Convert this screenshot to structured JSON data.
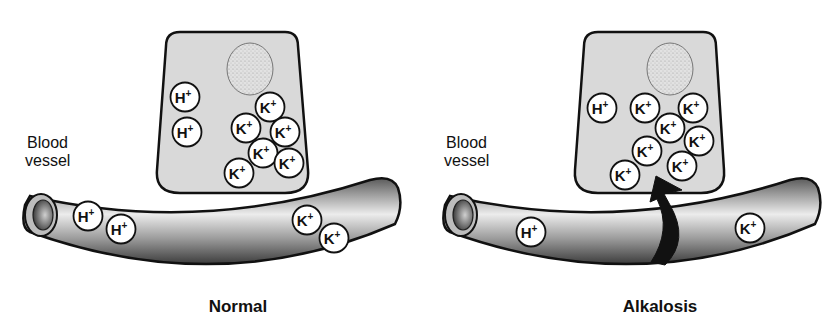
{
  "panels": [
    {
      "id": "normal",
      "caption": "Normal",
      "vessel_label_line1": "Blood",
      "vessel_label_line2": "vessel",
      "cell_ions": [
        {
          "type": "H",
          "label": "H",
          "sup": "+",
          "x": 185,
          "y": 97
        },
        {
          "type": "H",
          "label": "H",
          "sup": "+",
          "x": 187,
          "y": 132
        },
        {
          "type": "K",
          "label": "K",
          "sup": "+",
          "x": 270,
          "y": 107
        },
        {
          "type": "K",
          "label": "K",
          "sup": "+",
          "x": 246,
          "y": 128
        },
        {
          "type": "K",
          "label": "K",
          "sup": "+",
          "x": 285,
          "y": 132
        },
        {
          "type": "K",
          "label": "K",
          "sup": "+",
          "x": 263,
          "y": 153
        },
        {
          "type": "K",
          "label": "K",
          "sup": "+",
          "x": 289,
          "y": 163
        },
        {
          "type": "K",
          "label": "K",
          "sup": "+",
          "x": 239,
          "y": 173
        }
      ],
      "vessel_ions": [
        {
          "type": "H",
          "label": "H",
          "sup": "+",
          "x": 88,
          "y": 216
        },
        {
          "type": "H",
          "label": "H",
          "sup": "+",
          "x": 121,
          "y": 229
        },
        {
          "type": "K",
          "label": "K",
          "sup": "+",
          "x": 307,
          "y": 220
        },
        {
          "type": "K",
          "label": "K",
          "sup": "+",
          "x": 334,
          "y": 238
        }
      ]
    },
    {
      "id": "alkalosis",
      "caption": "Alkalosis",
      "vessel_label_line1": "Blood",
      "vessel_label_line2": "vessel",
      "arrow": "K+ shift from blood into cell",
      "cell_ions": [
        {
          "type": "H",
          "label": "H",
          "sup": "+",
          "x": 602,
          "y": 108
        },
        {
          "type": "K",
          "label": "K",
          "sup": "+",
          "x": 645,
          "y": 108
        },
        {
          "type": "K",
          "label": "K",
          "sup": "+",
          "x": 693,
          "y": 108
        },
        {
          "type": "K",
          "label": "K",
          "sup": "+",
          "x": 670,
          "y": 128
        },
        {
          "type": "K",
          "label": "K",
          "sup": "+",
          "x": 699,
          "y": 141
        },
        {
          "type": "K",
          "label": "K",
          "sup": "+",
          "x": 647,
          "y": 151
        },
        {
          "type": "K",
          "label": "K",
          "sup": "+",
          "x": 682,
          "y": 166
        },
        {
          "type": "K",
          "label": "K",
          "sup": "+",
          "x": 625,
          "y": 175
        }
      ],
      "vessel_ions": [
        {
          "type": "H",
          "label": "H",
          "sup": "+",
          "x": 531,
          "y": 232
        },
        {
          "type": "K",
          "label": "K",
          "sup": "+",
          "x": 750,
          "y": 228
        }
      ]
    }
  ],
  "colors": {
    "cell_fill": "#d9d9d9",
    "outline": "#111111",
    "ion_fill": "#ffffff",
    "vessel_dark": "#3a3a3a",
    "vessel_light": "#e8e8e8",
    "arrow": "#111111"
  }
}
